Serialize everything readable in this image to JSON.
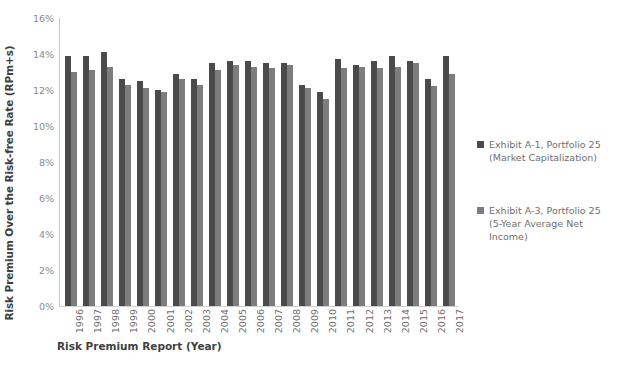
{
  "chart_data": {
    "type": "bar",
    "title": "",
    "xlabel": "Risk Premium Report (Year)",
    "ylabel": "Risk Premium Over the Risk-free Rate (RPm+s)",
    "ylim": [
      0,
      16
    ],
    "y_tick_labels": [
      "16%",
      "14%",
      "12%",
      "10%",
      "8%",
      "6%",
      "4%",
      "2%",
      "0%"
    ],
    "y_tick_values": [
      16,
      14,
      12,
      10,
      8,
      6,
      4,
      2,
      0
    ],
    "grid": false,
    "legend_position": "right",
    "categories": [
      "1996",
      "1997",
      "1998",
      "1999",
      "2000",
      "2001",
      "2002",
      "2003",
      "2004",
      "2005",
      "2006",
      "2007",
      "2008",
      "2009",
      "2010",
      "2011",
      "2012",
      "2013",
      "2014",
      "2015",
      "2016",
      "2017"
    ],
    "series": [
      {
        "name": "Exhibit A-1, Portfolio 25\n(Market Capitalization)",
        "color": "#4a4a4a",
        "values": [
          13.9,
          13.9,
          14.1,
          12.6,
          12.5,
          12.0,
          12.9,
          12.6,
          13.5,
          13.6,
          13.6,
          13.5,
          13.5,
          12.3,
          11.9,
          13.7,
          13.4,
          13.6,
          13.9,
          13.6,
          12.6,
          13.9
        ]
      },
      {
        "name": "Exhibit A-3, Portfolio 25\n(5-Year Average Net\nIncome)",
        "color": "#7d7d7d",
        "values": [
          13.0,
          13.1,
          13.3,
          12.3,
          12.1,
          11.9,
          12.6,
          12.3,
          13.1,
          13.4,
          13.3,
          13.2,
          13.4,
          12.1,
          11.5,
          13.2,
          13.3,
          13.2,
          13.3,
          13.5,
          12.2,
          12.9
        ]
      }
    ]
  },
  "legend": {
    "entries": [
      {
        "label": "Exhibit A-1, Portfolio 25\n(Market Capitalization)",
        "color": "#4a4a4a"
      },
      {
        "label": "Exhibit A-3, Portfolio 25\n(5-Year Average Net\nIncome)",
        "color": "#7d7d7d"
      }
    ]
  }
}
